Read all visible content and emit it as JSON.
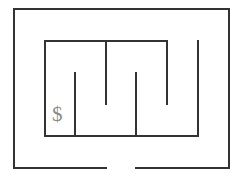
{
  "diagram": {
    "type": "maze",
    "colors": {
      "wall": "#333333",
      "symbol": "#8a8a8a",
      "background": "#ffffff"
    },
    "start_marker": {
      "label": "$",
      "position": [
        61,
        117
      ]
    },
    "exit_gap": {
      "from": [
        106,
        168
      ],
      "to": [
        136,
        168
      ]
    },
    "walls": [
      {
        "id": "outer-top",
        "x1": 14,
        "y1": 9,
        "x2": 229,
        "y2": 9
      },
      {
        "id": "outer-left",
        "x1": 14,
        "y1": 9,
        "x2": 14,
        "y2": 168
      },
      {
        "id": "outer-right",
        "x1": 229,
        "y1": 9,
        "x2": 229,
        "y2": 168
      },
      {
        "id": "outer-bottom-left",
        "x1": 14,
        "y1": 168,
        "x2": 106,
        "y2": 168
      },
      {
        "id": "outer-bottom-right",
        "x1": 136,
        "y1": 168,
        "x2": 229,
        "y2": 168
      },
      {
        "id": "inner-top",
        "x1": 45,
        "y1": 41,
        "x2": 167,
        "y2": 41
      },
      {
        "id": "inner-left",
        "x1": 45,
        "y1": 41,
        "x2": 45,
        "y2": 136
      },
      {
        "id": "inner-bottom",
        "x1": 45,
        "y1": 136,
        "x2": 198,
        "y2": 136
      },
      {
        "id": "inner-right",
        "x1": 198,
        "y1": 41,
        "x2": 198,
        "y2": 136
      },
      {
        "id": "spur-1-up",
        "x1": 75,
        "y1": 73,
        "x2": 75,
        "y2": 136
      },
      {
        "id": "spur-2-down",
        "x1": 106,
        "y1": 41,
        "x2": 106,
        "y2": 104
      },
      {
        "id": "spur-3-up",
        "x1": 136,
        "y1": 73,
        "x2": 136,
        "y2": 136
      },
      {
        "id": "spur-4-down",
        "x1": 167,
        "y1": 41,
        "x2": 167,
        "y2": 104
      }
    ]
  }
}
